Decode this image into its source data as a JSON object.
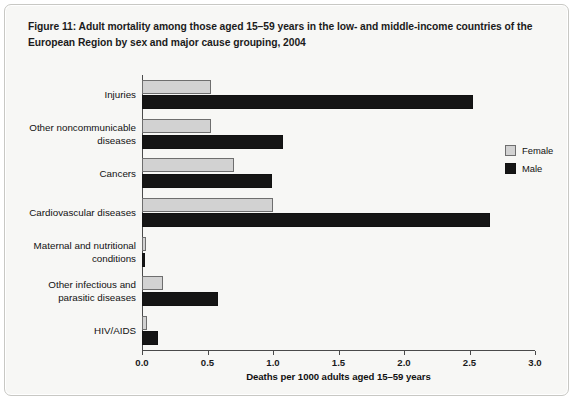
{
  "figure": {
    "caption": "Figure 11: Adult mortality among those aged 15–59 years in the low- and middle-income countries of the European Region by sex and major cause grouping, 2004"
  },
  "legend": {
    "position": "right",
    "entries": [
      {
        "label": "Female",
        "color": "#d2d2d2"
      },
      {
        "label": "Male",
        "color": "#151515"
      }
    ]
  },
  "chart_data": {
    "type": "bar",
    "orientation": "horizontal",
    "title": "Figure 11: Adult mortality among those aged 15–59 years in the low- and middle-income countries of the European Region by sex and major cause grouping, 2004",
    "xlabel": "Deaths per 1000 adults aged 15–59 years",
    "ylabel": "",
    "xlim": [
      0.0,
      3.0
    ],
    "xticks": [
      0.0,
      0.5,
      1.0,
      1.5,
      2.0,
      2.5,
      3.0
    ],
    "xtick_labels": [
      "0.0",
      "0.5",
      "1.0",
      "1.5",
      "2.0",
      "2.5",
      "3.0"
    ],
    "grid": false,
    "legend_position": "right",
    "categories": [
      "Injuries",
      "Other noncommunicable diseases",
      "Cancers",
      "Cardiovascular diseases",
      "Maternal and nutritional conditions",
      "Other infectious and parasitic diseases",
      "HIV/AIDS"
    ],
    "category_label_lines": [
      [
        "Injuries"
      ],
      [
        "Other noncommunicable",
        "diseases"
      ],
      [
        "Cancers"
      ],
      [
        "Cardiovascular diseases"
      ],
      [
        "Maternal and nutritional",
        "conditions"
      ],
      [
        "Other infectious and",
        "parasitic diseases"
      ],
      [
        "HIV/AIDS"
      ]
    ],
    "series": [
      {
        "name": "Female",
        "color": "#d2d2d2",
        "values": [
          0.53,
          0.53,
          0.7,
          1.0,
          0.03,
          0.16,
          0.04
        ]
      },
      {
        "name": "Male",
        "color": "#151515",
        "values": [
          2.53,
          1.08,
          0.99,
          2.66,
          0.02,
          0.58,
          0.12
        ]
      }
    ]
  }
}
